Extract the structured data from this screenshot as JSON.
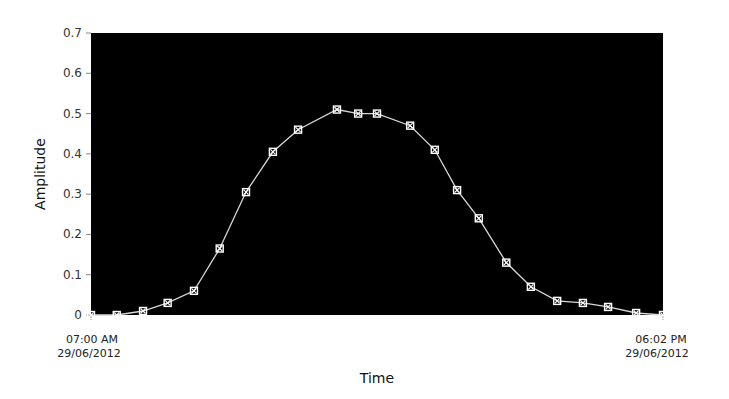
{
  "chart_data": {
    "type": "line",
    "title": "",
    "xlabel": "Time",
    "ylabel": "Amplitude",
    "ylim": [
      0,
      0.7
    ],
    "yticks": [
      "0",
      "0.1",
      "0.2",
      "0.3",
      "0.4",
      "0.5",
      "0.6",
      "0.7"
    ],
    "grid": false,
    "legend": null,
    "plot_background": "#000000",
    "line_color": "#d8d8d8",
    "marker_color": "#ffffff",
    "x_start_label": [
      "07:00 AM",
      "29/06/2012"
    ],
    "x_end_label": [
      "06:02 PM",
      "29/06/2012"
    ],
    "series": [
      {
        "name": "Amplitude",
        "x_fraction": [
          0.0,
          0.045,
          0.091,
          0.134,
          0.18,
          0.225,
          0.271,
          0.318,
          0.362,
          0.43,
          0.467,
          0.5,
          0.558,
          0.601,
          0.64,
          0.678,
          0.726,
          0.769,
          0.815,
          0.86,
          0.904,
          0.953,
          1.0
        ],
        "values": [
          0.0,
          0.0,
          0.01,
          0.03,
          0.06,
          0.165,
          0.305,
          0.405,
          0.46,
          0.51,
          0.5,
          0.5,
          0.47,
          0.41,
          0.31,
          0.24,
          0.13,
          0.07,
          0.035,
          0.03,
          0.02,
          0.005,
          0.0
        ]
      }
    ]
  }
}
